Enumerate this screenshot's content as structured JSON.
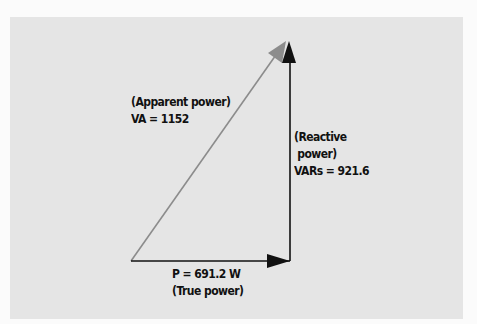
{
  "diagram": {
    "colors": {
      "background": "#fbfbfb",
      "panel": "#e5e5e5",
      "hypotenuse": "#8c8c8c",
      "legs": "#111111",
      "text": "#111111"
    },
    "apparent": {
      "line1": "(Apparent power)",
      "line2": "VA = 1152"
    },
    "reactive": {
      "line1": "(Reactive",
      "line2": " power)",
      "line3": "VARs = 921.6"
    },
    "true_power": {
      "line1": "P = 691.2 W",
      "line2": "(True power)"
    }
  }
}
